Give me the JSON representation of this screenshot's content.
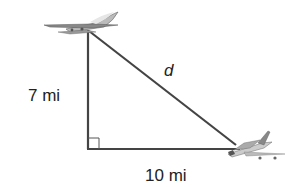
{
  "diagram": {
    "type": "right-triangle",
    "labels": {
      "vertical_side": "7 mi",
      "horizontal_side": "10 mi",
      "hypotenuse": "d"
    },
    "vertices": {
      "top": [
        88,
        30
      ],
      "right_angle": [
        88,
        149
      ],
      "bottom_right": [
        238,
        149
      ]
    },
    "icons": [
      "airplane-top",
      "airplane-bottom-right"
    ],
    "colors": {
      "line": "#444444",
      "text": "#222222"
    }
  }
}
